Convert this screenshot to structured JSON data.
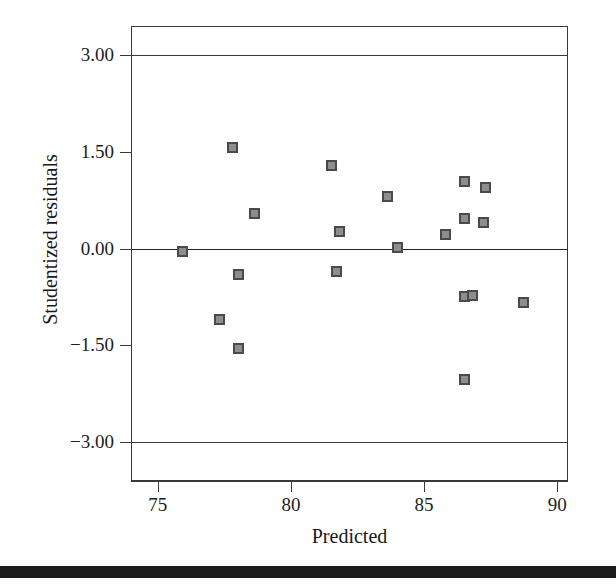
{
  "chart_data": {
    "type": "scatter",
    "title": "",
    "xlabel": "Predicted",
    "ylabel": "Studentized residuals",
    "xlim": [
      74.0,
      90.4
    ],
    "ylim": [
      -3.6,
      3.45
    ],
    "xticks": [
      75,
      80,
      85,
      90
    ],
    "xtick_labels": [
      "75",
      "80",
      "85",
      "90"
    ],
    "yticks": [
      3.0,
      1.5,
      0.0,
      -1.5,
      -3.0
    ],
    "ytick_labels": [
      "3.00",
      "1.50",
      "0.00",
      "−1.50",
      "−3.00"
    ],
    "grid": false,
    "legend": null,
    "reference_lines": [
      {
        "name": "upper-limit-line",
        "y": 3.0,
        "label": "3.00"
      },
      {
        "name": "zero-line",
        "y": 0.0,
        "label": "0.00"
      },
      {
        "name": "lower-limit-line",
        "y": -3.0,
        "label": "−3.00"
      }
    ],
    "marker": {
      "shape": "square",
      "fill_color": "#8d8d8d",
      "edge_color": "#4a4a4a",
      "size_px": 11
    },
    "points": [
      {
        "x": 75.9,
        "y": -0.04
      },
      {
        "x": 77.3,
        "y": -1.09
      },
      {
        "x": 77.8,
        "y": 1.57
      },
      {
        "x": 78.0,
        "y": -0.39
      },
      {
        "x": 78.0,
        "y": -1.54
      },
      {
        "x": 78.6,
        "y": 0.55
      },
      {
        "x": 81.5,
        "y": 1.3
      },
      {
        "x": 81.7,
        "y": -0.34
      },
      {
        "x": 81.8,
        "y": 0.27
      },
      {
        "x": 83.6,
        "y": 0.82
      },
      {
        "x": 84.0,
        "y": 0.02
      },
      {
        "x": 85.8,
        "y": 0.22
      },
      {
        "x": 86.5,
        "y": 1.05
      },
      {
        "x": 86.5,
        "y": 0.47
      },
      {
        "x": 86.5,
        "y": -0.74
      },
      {
        "x": 86.8,
        "y": -0.72
      },
      {
        "x": 86.5,
        "y": -2.02
      },
      {
        "x": 87.3,
        "y": 0.95
      },
      {
        "x": 87.2,
        "y": 0.41
      },
      {
        "x": 88.7,
        "y": -0.82
      }
    ]
  },
  "figure": {
    "x_axis_title": "Predicted",
    "y_axis_title": "Studentized residuals"
  }
}
